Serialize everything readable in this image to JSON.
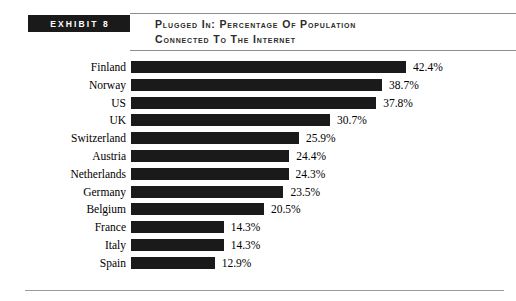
{
  "exhibit": {
    "badge_label": "EXHIBIT 8"
  },
  "title": {
    "line1": "Plugged in: Percentage of Population",
    "line2": "Connected to the Internet"
  },
  "chart_data": {
    "type": "bar",
    "orientation": "horizontal",
    "title": "Plugged in: Percentage of Population Connected to the Internet",
    "xlabel": "",
    "ylabel": "",
    "grid": false,
    "legend": "none",
    "value_suffix": "%",
    "xlim": [
      0,
      42.4
    ],
    "categories": [
      "Finland",
      "Norway",
      "US",
      "UK",
      "Switzerland",
      "Austria",
      "Netherlands",
      "Germany",
      "Belgium",
      "France",
      "Italy",
      "Spain"
    ],
    "values": [
      42.4,
      38.7,
      37.8,
      30.7,
      25.9,
      24.4,
      24.3,
      23.5,
      20.5,
      14.3,
      14.3,
      12.9
    ],
    "value_labels": [
      "42.4%",
      "38.7%",
      "37.8%",
      "30.7%",
      "25.9%",
      "24.4%",
      "24.3%",
      "23.5%",
      "20.5%",
      "14.3%",
      "14.3%",
      "12.9%"
    ],
    "bar_color": "#1a1a1a",
    "background_color": "#ffffff"
  }
}
